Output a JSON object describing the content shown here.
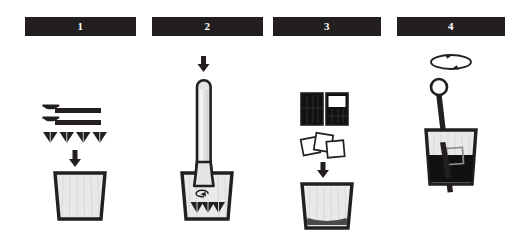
{
  "infographic": {
    "title": "Cocktail preparation steps",
    "background_color": "#ffffff",
    "ink_color": "#231f20",
    "glass_fill_color": "#e8e8e8",
    "liquid_color": "#1a1a1a"
  },
  "steps": [
    {
      "number": "1",
      "name": "add-mint-and-sugar",
      "elements": [
        {
          "icon": "bar-spoon-icon",
          "count": 2,
          "label": "bar spoon of sugar"
        },
        {
          "icon": "mint-leaf-icon",
          "count": 4,
          "label": "mint leaves"
        },
        {
          "icon": "down-arrow-icon",
          "count": 1,
          "label": "add into glass"
        },
        {
          "icon": "empty-glass-icon",
          "count": 1,
          "label": "empty tumbler glass"
        }
      ]
    },
    {
      "number": "2",
      "name": "muddle-ingredients",
      "elements": [
        {
          "icon": "down-arrow-icon",
          "count": 1,
          "label": "press down"
        },
        {
          "icon": "muddler-icon",
          "count": 1,
          "label": "muddler pestle"
        },
        {
          "icon": "twist-arrow-icon",
          "count": 1,
          "label": "twist motion"
        },
        {
          "icon": "crushed-mint-icon",
          "count": 3,
          "label": "crushed mint leaves"
        },
        {
          "icon": "glass-icon",
          "count": 1,
          "label": "tumbler glass"
        }
      ]
    },
    {
      "number": "3",
      "name": "add-spirit-and-ice",
      "elements": [
        {
          "icon": "measure-full-icon",
          "count": 1,
          "label": "full measure of spirit"
        },
        {
          "icon": "measure-partial-icon",
          "count": 1,
          "label": "partial measure of spirit"
        },
        {
          "icon": "ice-cube-icon",
          "count": 3,
          "label": "ice cubes"
        },
        {
          "icon": "down-arrow-icon",
          "count": 1,
          "label": "pour into glass"
        },
        {
          "icon": "glass-with-base-icon",
          "count": 1,
          "label": "glass with muddled base"
        }
      ]
    },
    {
      "number": "4",
      "name": "stir-the-drink",
      "elements": [
        {
          "icon": "rotate-arrow-icon",
          "count": 1,
          "label": "stir in circular motion"
        },
        {
          "icon": "bar-spoon-round-icon",
          "count": 1,
          "label": "bar spoon"
        },
        {
          "icon": "ice-cube-icon",
          "count": 1,
          "label": "ice cube"
        },
        {
          "icon": "filled-glass-icon",
          "count": 1,
          "label": "glass filled with drink"
        }
      ]
    }
  ]
}
